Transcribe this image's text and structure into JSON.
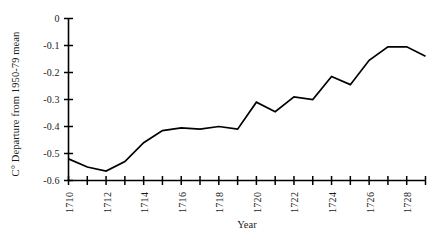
{
  "chart_data": {
    "type": "line",
    "title": "",
    "xlabel": "Year",
    "ylabel": "C° Departure from 1950-79 mean",
    "xlim": [
      1710,
      1729
    ],
    "ylim": [
      -0.6,
      0
    ],
    "grid": false,
    "legend": "none",
    "line_color": "#000000",
    "x_tick_labels": [
      "1710",
      "1712",
      "1714",
      "1716",
      "1718",
      "1720",
      "1722",
      "1724",
      "1726",
      "1728"
    ],
    "x_tick_values": [
      1710,
      1712,
      1714,
      1716,
      1718,
      1720,
      1722,
      1724,
      1726,
      1728
    ],
    "x_minor_ticks": [
      1711,
      1713,
      1715,
      1717,
      1719,
      1721,
      1723,
      1725,
      1727,
      1729
    ],
    "y_tick_labels": [
      "0",
      "-0.1",
      "-0.2",
      "-0.3",
      "-0.4",
      "-0.5",
      "-0.6"
    ],
    "y_tick_values": [
      0,
      -0.1,
      -0.2,
      -0.3,
      -0.4,
      -0.5,
      -0.6
    ],
    "x": [
      1710,
      1711,
      1712,
      1713,
      1714,
      1715,
      1716,
      1717,
      1718,
      1719,
      1720,
      1721,
      1722,
      1723,
      1724,
      1725,
      1726,
      1727,
      1728,
      1729
    ],
    "values": [
      -0.52,
      -0.55,
      -0.565,
      -0.53,
      -0.46,
      -0.415,
      -0.405,
      -0.41,
      -0.4,
      -0.41,
      -0.31,
      -0.345,
      -0.29,
      -0.3,
      -0.215,
      -0.245,
      -0.155,
      -0.105,
      -0.105,
      -0.14
    ]
  }
}
